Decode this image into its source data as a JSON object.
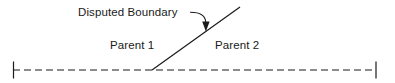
{
  "diagram": {
    "title": "Disputed Boundary",
    "width": 395,
    "height": 83,
    "background_color": "#ffffff",
    "line_color": "#1a1a1a",
    "text_color": "#1a1a1a",
    "annotation": {
      "label": "Disputed Boundary",
      "leader_line": "curved-leader-with-arrowhead",
      "arrow_target": "disputed-boundary-line"
    },
    "regions": [
      {
        "label": "Parent 1",
        "side": "left"
      },
      {
        "label": "Parent 2",
        "side": "right"
      }
    ],
    "baseline": {
      "style": "dashed",
      "dash_pattern": "7 4",
      "x_start": 13,
      "x_end": 376,
      "y": 70,
      "end_ticks": 2
    },
    "boundary_line": {
      "style": "solid",
      "x_start": 152,
      "y_start": 70,
      "x_end": 240,
      "y_end": 7
    }
  }
}
